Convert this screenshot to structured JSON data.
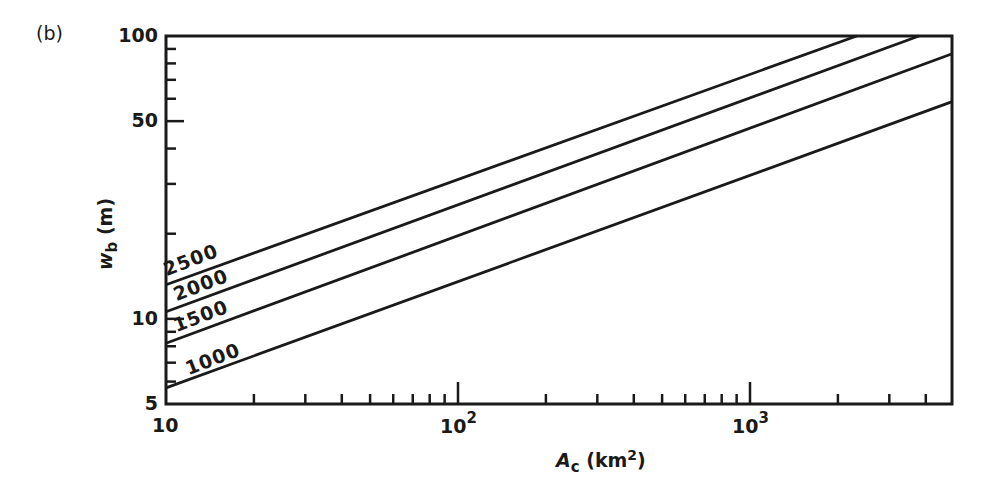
{
  "panel_label": "(b)",
  "axes": {
    "x": {
      "label_var": "A",
      "label_sub": "c",
      "label_unit_open": " (km",
      "label_unit_sup": "2",
      "label_unit_close": ")",
      "scale": "log",
      "range": [
        10,
        4900
      ],
      "major_ticks": [
        {
          "base": "10",
          "exp": ""
        },
        {
          "base": "10",
          "exp": "2"
        },
        {
          "base": "10",
          "exp": "3"
        }
      ]
    },
    "y": {
      "label_var": "w",
      "label_sub": "b",
      "label_unit": " (m)",
      "scale": "log",
      "range": [
        5,
        100
      ],
      "tick_labels": [
        "100",
        "50",
        "10",
        "5"
      ]
    }
  },
  "series_labels": [
    "2500",
    "2000",
    "1500",
    "1000"
  ],
  "chart_data": {
    "type": "line",
    "title": "",
    "xlabel": "A_c (km^2)",
    "ylabel": "w_b (m)",
    "xscale": "log",
    "yscale": "log",
    "xlim": [
      10,
      4900
    ],
    "ylim": [
      5,
      100
    ],
    "grid": false,
    "legend": "inline labels at left end of each line",
    "series": [
      {
        "name": "2500",
        "x": [
          10,
          2320
        ],
        "y": [
          13.2,
          100
        ]
      },
      {
        "name": "2000",
        "x": [
          10,
          3790
        ],
        "y": [
          10.6,
          100
        ]
      },
      {
        "name": "1500",
        "x": [
          10,
          4900
        ],
        "y": [
          8.2,
          86.4
        ]
      },
      {
        "name": "1000",
        "x": [
          10,
          4900
        ],
        "y": [
          5.7,
          58.5
        ]
      }
    ],
    "x_tick_labels": [
      "10",
      "10^2",
      "10^3"
    ],
    "y_tick_labels": [
      "5",
      "10",
      "50",
      "100"
    ]
  }
}
